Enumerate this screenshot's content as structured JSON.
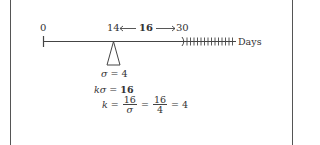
{
  "diagram": {
    "axis": {
      "start_label": "0",
      "left_marker_label": "14",
      "span_label": "16",
      "right_marker_label": "30",
      "unit_label": "Days"
    },
    "fulcrum": {
      "label_var": "σ",
      "label_eq": "= 4"
    },
    "equations": {
      "line1_lhs_k": "k",
      "line1_lhs_sigma": "σ",
      "line1_eq": "=",
      "line1_rhs": "16",
      "line2_k": "k",
      "line2_eq1": "=",
      "line2_frac1_num": "16",
      "line2_frac1_den": "σ",
      "line2_eq2": "=",
      "line2_frac2_num": "16",
      "line2_frac2_den": "4",
      "line2_eq3": "= 4"
    },
    "colors": {
      "line": "#444444",
      "text": "#333333",
      "frame": "#555555"
    }
  }
}
